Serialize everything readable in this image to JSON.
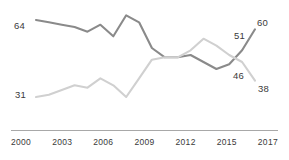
{
  "chart_data": {
    "type": "line",
    "title": "",
    "subtitle": "",
    "xlabel": "",
    "ylabel": "",
    "grid": false,
    "legend": "none",
    "xlim": [
      2000,
      2017
    ],
    "ylim": [
      28,
      67
    ],
    "x": [
      2000,
      2001,
      2002,
      2003,
      2004,
      2005,
      2006,
      2007,
      2008,
      2009,
      2010,
      2011,
      2012,
      2013,
      2014,
      2015,
      2016,
      2017
    ],
    "xticks": [
      "2000",
      "2003",
      "2006",
      "2009",
      "2012",
      "2015",
      "2017"
    ],
    "series": [
      {
        "name": "dark-series",
        "color": "#8a8a8a",
        "values": [
          64,
          63,
          62,
          61,
          59,
          62,
          57,
          66,
          63,
          52,
          48,
          48,
          49,
          46,
          43,
          45,
          51,
          60
        ],
        "start_label": "64",
        "end_label": "60",
        "mid_label": "51"
      },
      {
        "name": "light-series",
        "color": "#d0d0d0",
        "values": [
          31,
          32,
          34,
          36,
          35,
          39,
          36,
          31,
          39,
          47,
          48,
          48,
          51,
          56,
          53,
          49,
          46,
          38
        ],
        "start_label": "31",
        "end_label": "38",
        "mid_label": "46"
      }
    ],
    "annotations": [
      {
        "name": "label-64",
        "text": "64",
        "series": "dark-series",
        "x": 2000,
        "value": 64
      },
      {
        "name": "label-31",
        "text": "31",
        "series": "light-series",
        "x": 2000,
        "value": 31
      },
      {
        "name": "label-51",
        "text": "51",
        "series": "dark-series",
        "x": 2016,
        "value": 51
      },
      {
        "name": "label-46",
        "text": "46",
        "series": "light-series",
        "x": 2016,
        "value": 46
      },
      {
        "name": "label-60",
        "text": "60",
        "series": "dark-series",
        "x": 2017,
        "value": 60
      },
      {
        "name": "label-38",
        "text": "38",
        "series": "light-series",
        "x": 2017,
        "value": 38
      }
    ]
  },
  "labels": {
    "start_dark": "64",
    "start_light": "31",
    "mid_dark": "51",
    "mid_light": "46",
    "end_dark": "60",
    "end_light": "38"
  },
  "axis": {
    "ticks": [
      {
        "label": "2000"
      },
      {
        "label": "2003"
      },
      {
        "label": "2006"
      },
      {
        "label": "2009"
      },
      {
        "label": "2012"
      },
      {
        "label": "2015"
      },
      {
        "label": "2017"
      }
    ]
  },
  "colors": {
    "dark_line": "#8a8a8a",
    "light_line": "#d0d0d0",
    "axis": "#a8a8a8",
    "text": "#3a3a3a",
    "background": "#ffffff"
  }
}
